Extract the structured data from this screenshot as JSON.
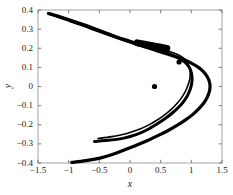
{
  "chart_data": {
    "type": "scatter",
    "title": "",
    "xlabel": "x",
    "ylabel": "y",
    "xlim": [
      -1.5,
      1.5
    ],
    "ylim": [
      -0.4,
      0.4
    ],
    "xticks": [
      -1.5,
      -1,
      -0.5,
      0,
      0.5,
      1,
      1.5
    ],
    "xticklabels": [
      "-1.5",
      "-1",
      "-0.5",
      "0",
      "0.5",
      "1",
      "1.5"
    ],
    "yticks": [
      -0.4,
      -0.3,
      -0.2,
      -0.1,
      0,
      0.1,
      0.2,
      0.3,
      0.4
    ],
    "yticklabels": [
      "-0.4",
      "-0.3",
      "-0.2",
      "-0.1",
      "0",
      "0.1",
      "0.2",
      "0.3",
      "0.4"
    ],
    "grid": false,
    "legend": null,
    "series": [
      {
        "name": "outer-branch",
        "type": "line",
        "color": "#000000",
        "linewidth": 3.2,
        "points": [
          [
            -1.33,
            0.382
          ],
          [
            -1.18,
            0.368
          ],
          [
            -1.02,
            0.352
          ],
          [
            -0.86,
            0.335
          ],
          [
            -0.7,
            0.317
          ],
          [
            -0.54,
            0.298
          ],
          [
            -0.38,
            0.279
          ],
          [
            -0.22,
            0.259
          ],
          [
            -0.06,
            0.24
          ],
          [
            0.1,
            0.222
          ],
          [
            0.26,
            0.205
          ],
          [
            0.42,
            0.189
          ],
          [
            0.58,
            0.173
          ],
          [
            0.73,
            0.157
          ],
          [
            0.87,
            0.141
          ],
          [
            1.0,
            0.122
          ],
          [
            1.11,
            0.101
          ],
          [
            1.2,
            0.077
          ],
          [
            1.26,
            0.051
          ],
          [
            1.295,
            0.024
          ],
          [
            1.305,
            -0.003
          ],
          [
            1.29,
            -0.031
          ],
          [
            1.255,
            -0.059
          ],
          [
            1.2,
            -0.088
          ],
          [
            1.12,
            -0.117
          ],
          [
            1.02,
            -0.147
          ],
          [
            0.9,
            -0.176
          ],
          [
            0.76,
            -0.205
          ],
          [
            0.6,
            -0.234
          ],
          [
            0.42,
            -0.262
          ],
          [
            0.22,
            -0.292
          ],
          [
            0.0,
            -0.32
          ],
          [
            -0.22,
            -0.348
          ],
          [
            -0.46,
            -0.372
          ],
          [
            -0.72,
            -0.388
          ],
          [
            -0.95,
            -0.397
          ]
        ]
      },
      {
        "name": "inner-branch",
        "type": "line",
        "color": "#000000",
        "linewidth": 3.0,
        "points": [
          [
            -1.3,
            0.379
          ],
          [
            -1.14,
            0.362
          ],
          [
            -0.98,
            0.344
          ],
          [
            -0.82,
            0.326
          ],
          [
            -0.66,
            0.307
          ],
          [
            -0.5,
            0.289
          ],
          [
            -0.34,
            0.27
          ],
          [
            -0.18,
            0.252
          ],
          [
            -0.02,
            0.235
          ],
          [
            0.14,
            0.219
          ],
          [
            0.3,
            0.204
          ],
          [
            0.45,
            0.19
          ],
          [
            0.58,
            0.177
          ],
          [
            0.7,
            0.163
          ],
          [
            0.81,
            0.146
          ],
          [
            0.9,
            0.126
          ],
          [
            0.965,
            0.101
          ],
          [
            1.0,
            0.073
          ],
          [
            1.012,
            0.044
          ],
          [
            1.005,
            0.014
          ],
          [
            0.98,
            -0.016
          ],
          [
            0.94,
            -0.046
          ],
          [
            0.88,
            -0.076
          ],
          [
            0.8,
            -0.106
          ],
          [
            0.7,
            -0.136
          ],
          [
            0.58,
            -0.166
          ],
          [
            0.44,
            -0.196
          ],
          [
            0.28,
            -0.226
          ],
          [
            0.1,
            -0.252
          ],
          [
            -0.1,
            -0.27
          ],
          [
            -0.32,
            -0.28
          ],
          [
            -0.58,
            -0.287
          ]
        ]
      },
      {
        "name": "middle-strand",
        "type": "line",
        "color": "#000000",
        "linewidth": 1.6,
        "points": [
          [
            -1.31,
            0.38
          ],
          [
            -1.1,
            0.357
          ],
          [
            -0.88,
            0.332
          ],
          [
            -0.66,
            0.308
          ],
          [
            -0.44,
            0.285
          ],
          [
            -0.22,
            0.262
          ],
          [
            0.0,
            0.241
          ],
          [
            0.2,
            0.222
          ],
          [
            0.38,
            0.206
          ],
          [
            0.54,
            0.192
          ],
          [
            0.68,
            0.179
          ],
          [
            0.8,
            0.163
          ],
          [
            0.89,
            0.144
          ],
          [
            0.945,
            0.12
          ],
          [
            0.975,
            0.093
          ],
          [
            0.982,
            0.064
          ],
          [
            0.972,
            0.035
          ],
          [
            0.945,
            0.006
          ],
          [
            0.905,
            -0.024
          ],
          [
            0.85,
            -0.054
          ],
          [
            0.78,
            -0.084
          ],
          [
            0.69,
            -0.114
          ],
          [
            0.58,
            -0.144
          ],
          [
            0.45,
            -0.174
          ],
          [
            0.3,
            -0.202
          ],
          [
            0.12,
            -0.228
          ],
          [
            -0.08,
            -0.248
          ],
          [
            -0.3,
            -0.262
          ],
          [
            -0.52,
            -0.272
          ]
        ]
      },
      {
        "name": "dense-cluster",
        "type": "line",
        "color": "#000000",
        "linewidth": 7.0,
        "points": [
          [
            0.12,
            0.228
          ],
          [
            0.22,
            0.222
          ],
          [
            0.32,
            0.216
          ],
          [
            0.42,
            0.21
          ],
          [
            0.52,
            0.204
          ],
          [
            0.6,
            0.199
          ]
        ]
      },
      {
        "name": "isolated-points",
        "type": "scatter",
        "color": "#000000",
        "markersize": 2.6,
        "points": [
          [
            0.8,
            0.128
          ],
          [
            0.4,
            0.0
          ]
        ]
      }
    ]
  },
  "axes": {
    "frame_color": "#9a9a9a",
    "tick_color": "#6e6e6e",
    "background": "#ffffff",
    "curve_color": "#000000"
  }
}
